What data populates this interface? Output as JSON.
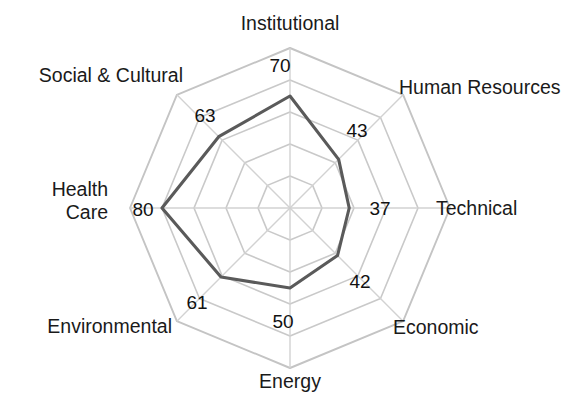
{
  "chart_data": {
    "type": "radar",
    "title": "",
    "subtitle": "",
    "xlabel": "",
    "ylabel": "",
    "legend": [],
    "legend_position": "none",
    "grid": true,
    "rings": 5,
    "rmin": 0,
    "rmax": 100,
    "categories": [
      "Institutional",
      "Human Resources",
      "Technical",
      "Economic",
      "Energy",
      "Environmental",
      "Health Care",
      "Social & Cultural"
    ],
    "values": [
      70,
      43,
      37,
      42,
      50,
      61,
      80,
      63
    ],
    "value_labels": [
      "70",
      "43",
      "37",
      "42",
      "50",
      "61",
      "80",
      "63"
    ],
    "series": [
      {
        "name": "",
        "values": [
          70,
          43,
          37,
          42,
          50,
          61,
          80,
          63
        ],
        "color": "#5a5a5a"
      }
    ],
    "colors": {
      "series_line": "#5a5a5a",
      "grid": "#c9c9c9",
      "spoke": "#d2d2d2",
      "text": "#1a1a1a",
      "background": "#ffffff"
    }
  },
  "axes": [
    {
      "id": "institutional",
      "name": "Institutional",
      "value": 70,
      "value_text": "70",
      "label_x": 290,
      "label_y": 30,
      "label_anchor": "middle",
      "value_x": 280,
      "value_y": 72,
      "value_anchor": "middle"
    },
    {
      "id": "human-resources",
      "name": "Human Resources",
      "value": 43,
      "value_text": "43",
      "label_x": 399,
      "label_y": 94,
      "label_anchor": "start",
      "value_x": 357,
      "value_y": 137,
      "value_anchor": "middle"
    },
    {
      "id": "technical",
      "name": "Technical",
      "value": 37,
      "value_text": "37",
      "label_x": 436,
      "label_y": 215,
      "label_anchor": "start",
      "value_x": 380,
      "value_y": 215,
      "value_anchor": "middle"
    },
    {
      "id": "economic",
      "name": "Economic",
      "value": 42,
      "value_text": "42",
      "label_x": 393,
      "label_y": 334,
      "label_anchor": "start",
      "value_x": 360,
      "value_y": 288,
      "value_anchor": "middle"
    },
    {
      "id": "energy",
      "name": "Energy",
      "value": 50,
      "value_text": "50",
      "label_x": 290,
      "label_y": 388,
      "label_anchor": "middle",
      "value_x": 283,
      "value_y": 328,
      "value_anchor": "middle"
    },
    {
      "id": "environmental",
      "name": "Environmental",
      "value": 61,
      "value_text": "61",
      "label_x": 172,
      "label_y": 333,
      "label_anchor": "end",
      "value_x": 197,
      "value_y": 309,
      "value_anchor": "middle"
    },
    {
      "id": "health-care",
      "name": "Health Care",
      "name_line1": "Health",
      "name_line2": "Care",
      "value": 80,
      "value_text": "80",
      "label_x": 108,
      "label_y": 196,
      "label_anchor": "end",
      "value_x": 143,
      "value_y": 216,
      "value_anchor": "middle"
    },
    {
      "id": "social-cultural",
      "name": "Social & Cultural",
      "value": 63,
      "value_text": "63",
      "label_x": 183,
      "label_y": 82,
      "label_anchor": "end",
      "value_x": 205,
      "value_y": 122,
      "value_anchor": "middle"
    }
  ],
  "geometry": {
    "cx": 290,
    "cy": 208,
    "radius": 160,
    "ring_count": 5,
    "axis_count": 8,
    "start_angle_deg": -90
  }
}
